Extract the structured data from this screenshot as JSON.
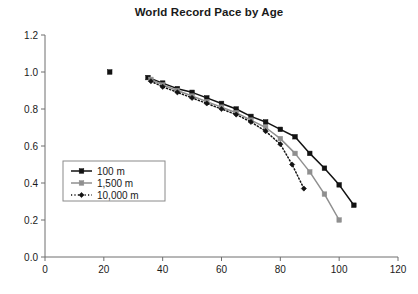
{
  "chart_data": {
    "type": "line",
    "title": "World Record Pace by Age",
    "xlabel": "",
    "ylabel": "",
    "xlim": [
      0,
      120
    ],
    "ylim": [
      0.0,
      1.2
    ],
    "xticks": [
      0,
      20,
      40,
      60,
      80,
      100,
      120
    ],
    "yticks": [
      "0.0",
      "0.2",
      "0.4",
      "0.6",
      "0.8",
      "1.0",
      "1.2"
    ],
    "xtick_labels": [
      "0",
      "20",
      "40",
      "60",
      "80",
      "100",
      "120"
    ],
    "grid": false,
    "legend_position": "center-left",
    "series": [
      {
        "name": "100 m",
        "color": "#121212",
        "line_style": "solid",
        "marker": "square",
        "x": [
          22,
          35,
          40,
          45,
          50,
          55,
          60,
          65,
          70,
          75,
          80,
          85,
          90,
          95,
          100,
          105
        ],
        "y": [
          1.0,
          0.97,
          0.94,
          0.91,
          0.89,
          0.86,
          0.83,
          0.8,
          0.76,
          0.73,
          0.69,
          0.65,
          0.56,
          0.48,
          0.39,
          0.28
        ]
      },
      {
        "name": "1,500 m",
        "color": "#8f8f8f",
        "line_style": "solid",
        "marker": "square",
        "x": [
          36,
          40,
          45,
          50,
          55,
          60,
          65,
          70,
          75,
          80,
          85,
          90,
          95,
          100
        ],
        "y": [
          0.96,
          0.93,
          0.9,
          0.87,
          0.84,
          0.81,
          0.78,
          0.74,
          0.7,
          0.64,
          0.56,
          0.46,
          0.34,
          0.2
        ]
      },
      {
        "name": "10,000 m",
        "color": "#121212",
        "line_style": "dotted",
        "marker": "diamond",
        "x": [
          36,
          40,
          45,
          50,
          55,
          60,
          65,
          70,
          75,
          80,
          84,
          88
        ],
        "y": [
          0.95,
          0.92,
          0.89,
          0.86,
          0.83,
          0.8,
          0.77,
          0.73,
          0.68,
          0.61,
          0.5,
          0.37
        ]
      }
    ]
  },
  "legend": {
    "entries": [
      {
        "label": "100 m"
      },
      {
        "label": "1,500 m"
      },
      {
        "label": "10,000 m"
      }
    ]
  }
}
